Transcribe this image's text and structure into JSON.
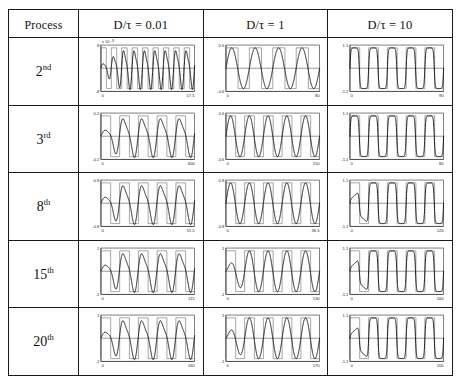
{
  "figure": {
    "kind": "table-of-plots",
    "rows": 5,
    "cols": 3,
    "background": "#ffffff",
    "border_color": "#1a1a1a",
    "wave_color": "#111111",
    "pulse_color": "#8a8a8a"
  },
  "header": {
    "label_col": "Process",
    "columns": [
      {
        "id": "d001",
        "label": "D/τ = 0.01"
      },
      {
        "id": "d1",
        "label": "D/τ = 1"
      },
      {
        "id": "d10",
        "label": "D/τ = 10"
      }
    ]
  },
  "rows": [
    {
      "id": "p2",
      "ordinal": "2",
      "suffix": "nd"
    },
    {
      "id": "p3",
      "ordinal": "3",
      "suffix": "rd"
    },
    {
      "id": "p8",
      "ordinal": "8",
      "suffix": "th"
    },
    {
      "id": "p15",
      "ordinal": "15",
      "suffix": "th"
    },
    {
      "id": "p20",
      "ordinal": "20",
      "suffix": "th"
    }
  ],
  "chart_data": {
    "type": "line",
    "title": "",
    "xlabel": "",
    "ylabel": "",
    "grid": false,
    "legend": "none",
    "panel_layout": {
      "rows": 5,
      "cols": 3
    },
    "row_categories": [
      "2nd",
      "3rd",
      "8th",
      "15th",
      "20th"
    ],
    "col_categories": [
      "D/τ = 0.01",
      "D/τ = 1",
      "D/τ = 10"
    ],
    "panels": [
      {
        "row": "2nd",
        "col": "D/τ = 0.01",
        "ylim": [
          -0.008,
          0.008
        ],
        "ytick_top": "8",
        "ytick_bottom": "-8",
        "y_scale_note": "x 10",
        "y_scale_exp": "-3",
        "xlim": [
          0,
          17.5
        ],
        "xtick_left": "0",
        "xtick_right": "17.5",
        "cycles": 9,
        "pulse_cycles": 9,
        "waveform": "oscillatory-burst",
        "damping": 0.0,
        "transient_cycles": 2
      },
      {
        "row": "2nd",
        "col": "D/τ = 1",
        "ylim": [
          -0.6,
          0.6
        ],
        "ytick_top": "0.6",
        "ytick_bottom": "-0.6",
        "xlim": [
          0,
          80
        ],
        "xtick_left": "0",
        "xtick_right": "80",
        "cycles": 4,
        "pulse_cycles": 4,
        "waveform": "sinusoid",
        "damping": 0.0,
        "transient_cycles": 0
      },
      {
        "row": "2nd",
        "col": "D/τ = 10",
        "ylim": [
          -1.1,
          1.1
        ],
        "ytick_top": "1.1",
        "ytick_bottom": "-1.1",
        "xlim": [
          0,
          90
        ],
        "xtick_left": "0",
        "xtick_right": "90",
        "cycles": 5,
        "pulse_cycles": 5,
        "waveform": "square-like",
        "damping": 0.0,
        "transient_cycles": 0
      },
      {
        "row": "3rd",
        "col": "D/τ = 0.01",
        "ylim": [
          -0.2,
          0.2
        ],
        "ytick_top": "0.2",
        "ytick_bottom": "-0.2",
        "xlim": [
          0,
          600
        ],
        "xtick_left": "0",
        "xtick_right": "600",
        "cycles": 5,
        "pulse_cycles": 5,
        "waveform": "oscillatory-burst",
        "damping": 0.0,
        "transient_cycles": 1
      },
      {
        "row": "3rd",
        "col": "D/τ = 1",
        "ylim": [
          -0.6,
          0.6
        ],
        "ytick_top": "0.6",
        "ytick_bottom": "-0.6",
        "xlim": [
          0,
          150
        ],
        "xtick_left": "0",
        "xtick_right": "150",
        "cycles": 5,
        "pulse_cycles": 5,
        "waveform": "sinusoid",
        "damping": 0.0,
        "transient_cycles": 0
      },
      {
        "row": "3rd",
        "col": "D/τ = 10",
        "ylim": [
          -1.1,
          1.1
        ],
        "ytick_top": "1.1",
        "ytick_bottom": "-1.1",
        "xlim": [
          0,
          80
        ],
        "xtick_left": "0",
        "xtick_right": "80",
        "cycles": 5,
        "pulse_cycles": 5,
        "waveform": "square-like",
        "damping": 0.0,
        "transient_cycles": 0
      },
      {
        "row": "8th",
        "col": "D/τ = 0.01",
        "ylim": [
          -0.8,
          0.8
        ],
        "ytick_top": "0.8",
        "ytick_bottom": "-0.8",
        "xlim": [
          0,
          51.5
        ],
        "xtick_left": "0",
        "xtick_right": "51.5",
        "cycles": 5,
        "pulse_cycles": 5,
        "waveform": "oscillatory-burst",
        "damping": 0.0,
        "transient_cycles": 1
      },
      {
        "row": "8th",
        "col": "D/τ = 1",
        "ylim": [
          -0.8,
          0.8
        ],
        "ytick_top": "0.8",
        "ytick_bottom": "-0.8",
        "xlim": [
          0,
          36.5
        ],
        "xtick_left": "0",
        "xtick_right": "36.5",
        "cycles": 5,
        "pulse_cycles": 5,
        "waveform": "sinusoid",
        "damping": 0.0,
        "transient_cycles": 0
      },
      {
        "row": "8th",
        "col": "D/τ = 10",
        "ylim": [
          -1.1,
          1.1
        ],
        "ytick_top": "1.1",
        "ytick_bottom": "-1.1",
        "xlim": [
          0,
          120
        ],
        "xtick_left": "0",
        "xtick_right": "120",
        "cycles": 5,
        "pulse_cycles": 5,
        "waveform": "square-like",
        "damping": 0.0,
        "transient_cycles": 1
      },
      {
        "row": "15th",
        "col": "D/τ = 0.01",
        "ylim": [
          -1,
          1
        ],
        "ytick_top": "1",
        "ytick_bottom": "-1",
        "xlim": [
          0,
          115
        ],
        "xtick_left": "0",
        "xtick_right": "115",
        "cycles": 5,
        "pulse_cycles": 5,
        "waveform": "oscillatory-burst",
        "damping": 0.0,
        "transient_cycles": 1
      },
      {
        "row": "15th",
        "col": "D/τ = 1",
        "ylim": [
          -1,
          1
        ],
        "ytick_top": "1",
        "ytick_bottom": "-1",
        "xlim": [
          0,
          130
        ],
        "xtick_left": "0",
        "xtick_right": "130",
        "cycles": 5,
        "pulse_cycles": 5,
        "waveform": "sinusoid",
        "damping": 0.0,
        "transient_cycles": 1
      },
      {
        "row": "15th",
        "col": "D/τ = 10",
        "ylim": [
          -1.1,
          1.1
        ],
        "ytick_top": "1.1",
        "ytick_bottom": "-1.1",
        "xlim": [
          0,
          160
        ],
        "xtick_left": "0",
        "xtick_right": "160",
        "cycles": 5,
        "pulse_cycles": 5,
        "waveform": "square-like",
        "damping": 0.0,
        "transient_cycles": 1
      },
      {
        "row": "20th",
        "col": "D/τ = 0.01",
        "ylim": [
          -1,
          1
        ],
        "ytick_top": "1",
        "ytick_bottom": "-1",
        "xlim": [
          0,
          160
        ],
        "xtick_left": "0",
        "xtick_right": "160",
        "cycles": 5,
        "pulse_cycles": 5,
        "waveform": "oscillatory-burst",
        "damping": 0.0,
        "transient_cycles": 1
      },
      {
        "row": "20th",
        "col": "D/τ = 1",
        "ylim": [
          -1,
          1
        ],
        "ytick_top": "1",
        "ytick_bottom": "-1",
        "xlim": [
          0,
          170
        ],
        "xtick_left": "0",
        "xtick_right": "170",
        "cycles": 5,
        "pulse_cycles": 5,
        "waveform": "sinusoid",
        "damping": 0.0,
        "transient_cycles": 1
      },
      {
        "row": "20th",
        "col": "D/τ = 10",
        "ylim": [
          -1.1,
          1.1
        ],
        "ytick_top": "1.1",
        "ytick_bottom": "-1.1",
        "xlim": [
          0,
          200
        ],
        "xtick_left": "0",
        "xtick_right": "200",
        "cycles": 5,
        "pulse_cycles": 5,
        "waveform": "square-like",
        "damping": 0.0,
        "transient_cycles": 1
      }
    ]
  }
}
